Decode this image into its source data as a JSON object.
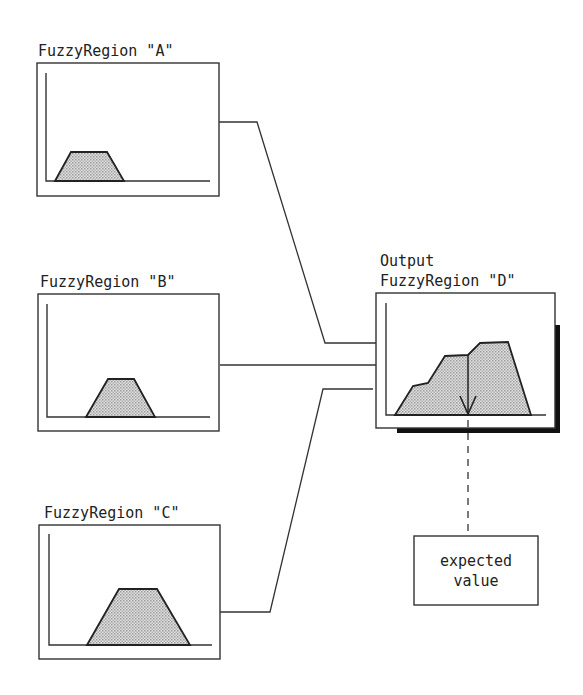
{
  "diagram": {
    "inputs": [
      {
        "id": "A",
        "label": "FuzzyRegion \"A\"",
        "trapezoid": {
          "bottom_left": 55,
          "top_left": 71,
          "top_right": 107,
          "bottom_right": 124
        }
      },
      {
        "id": "B",
        "label": "FuzzyRegion \"B\"",
        "trapezoid": {
          "bottom_left": 86,
          "top_left": 108,
          "top_right": 134,
          "bottom_right": 155
        }
      },
      {
        "id": "C",
        "label": "FuzzyRegion \"C\"",
        "trapezoid": {
          "bottom_left": 87,
          "top_left": 119,
          "top_right": 157,
          "bottom_right": 190
        }
      }
    ],
    "output": {
      "id": "D",
      "label_line1": "Output",
      "label_line2": "FuzzyRegion \"D\""
    },
    "result": {
      "label_line1": "expected",
      "label_line2": "value"
    },
    "colors": {
      "stroke": "#333333",
      "fill_pattern": "#bdbdbd",
      "shadow": "#111111"
    }
  }
}
